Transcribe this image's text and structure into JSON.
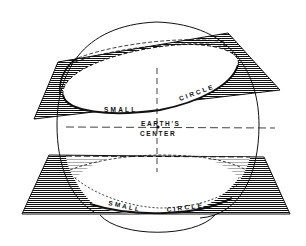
{
  "diagram": {
    "type": "sphere-small-circles",
    "labels": {
      "upper_small": "SMALL",
      "upper_circle": "CIRCLE",
      "center_line1": "EARTH'S",
      "center_line2": "CENTER",
      "lower_small": "SMALL",
      "lower_circle": "CIRCLE"
    },
    "colors": {
      "ink": "#111111",
      "background": "#ffffff"
    }
  }
}
